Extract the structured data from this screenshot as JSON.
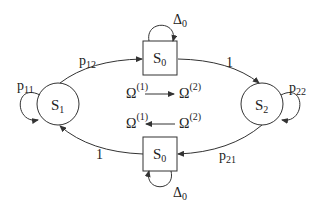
{
  "diagram": {
    "type": "state-transition",
    "nodes": [
      {
        "id": "S1",
        "label": "S",
        "sub": "1",
        "shape": "circle"
      },
      {
        "id": "S0_top",
        "label": "S",
        "sub": "0",
        "shape": "square"
      },
      {
        "id": "S2",
        "label": "S",
        "sub": "2",
        "shape": "circle"
      },
      {
        "id": "S0_bottom",
        "label": "S",
        "sub": "0",
        "shape": "square"
      }
    ],
    "edges": [
      {
        "from": "S1",
        "to": "S0_top",
        "label": "p",
        "sub": "12"
      },
      {
        "from": "S0_top",
        "to": "S2",
        "label": "1",
        "sub": ""
      },
      {
        "from": "S2",
        "to": "S0_bottom",
        "label": "p",
        "sub": "21"
      },
      {
        "from": "S0_bottom",
        "to": "S1",
        "label": "1",
        "sub": ""
      },
      {
        "from": "S1",
        "to": "S1",
        "label": "p",
        "sub": "11"
      },
      {
        "from": "S2",
        "to": "S2",
        "label": "p",
        "sub": "22"
      },
      {
        "from": "S0_top",
        "to": "S0_top",
        "label": "Δ",
        "sub": "0"
      },
      {
        "from": "S0_bottom",
        "to": "S0_bottom",
        "label": "Δ",
        "sub": "0"
      }
    ],
    "transitions": [
      {
        "from": "Ω",
        "from_sup": "(1)",
        "to": "Ω",
        "to_sup": "(2)",
        "direction": "right"
      },
      {
        "from": "Ω",
        "from_sup": "(1)",
        "to": "Ω",
        "to_sup": "(2)",
        "direction": "left"
      }
    ]
  }
}
